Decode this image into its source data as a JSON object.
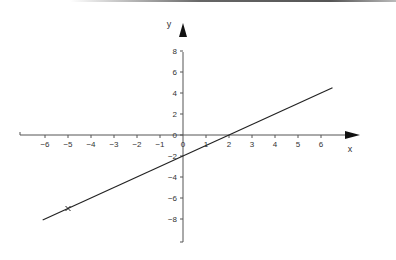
{
  "chart_data": {
    "type": "line",
    "title": "",
    "xlabel": "x",
    "ylabel": "y",
    "xlim": [
      -7,
      7.5
    ],
    "ylim": [
      -10.3,
      10.5
    ],
    "grid": false,
    "x_ticks": [
      -6,
      -5,
      -4,
      -3,
      -2,
      -1,
      0,
      1,
      2,
      3,
      4,
      5,
      6
    ],
    "y_ticks": [
      -8,
      -6,
      -4,
      -2,
      0,
      2,
      4,
      6,
      8
    ],
    "x_tick_labels": [
      "−6",
      "−5",
      "−4",
      "−3",
      "−2",
      "−1",
      "0",
      "1",
      "2",
      "3",
      "4",
      "5",
      "6"
    ],
    "y_tick_labels": [
      "−8",
      "−6",
      "−4",
      "−2",
      "0",
      "2",
      "4",
      "6",
      "8"
    ],
    "series": [
      {
        "name": "y = x − 2",
        "x": [
          -6.1,
          6.5
        ],
        "y": [
          -8.1,
          4.5
        ]
      }
    ],
    "annotations": [
      {
        "type": "marker",
        "symbol": "x",
        "x": -5,
        "y": -7
      }
    ]
  }
}
